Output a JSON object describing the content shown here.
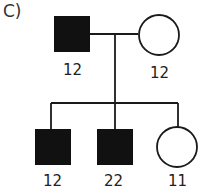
{
  "panel_label": "C)",
  "colors": {
    "affected": "#111111",
    "line": "#1a1a1a",
    "unaffected_fill": "#ffffff"
  },
  "parents": {
    "father": {
      "sex": "male",
      "affected": true,
      "label": "12"
    },
    "mother": {
      "sex": "female",
      "affected": false,
      "label": "12"
    }
  },
  "children": [
    {
      "sex": "male",
      "affected": true,
      "label": "12"
    },
    {
      "sex": "male",
      "affected": true,
      "label": "22"
    },
    {
      "sex": "female",
      "affected": false,
      "label": "11"
    }
  ]
}
